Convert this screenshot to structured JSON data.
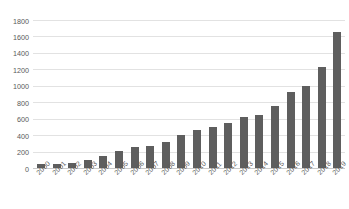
{
  "chart_data": {
    "type": "bar",
    "title": "",
    "subtitle": "",
    "xlabel": "",
    "ylabel": "",
    "categories": [
      "2000",
      "2001",
      "2002",
      "2003",
      "2004",
      "2005",
      "2006",
      "2007",
      "2008",
      "2009",
      "2010",
      "2011",
      "2012",
      "2013",
      "2014",
      "2015",
      "2016",
      "2017",
      "2018",
      "2019"
    ],
    "values": [
      45,
      45,
      65,
      100,
      150,
      205,
      255,
      270,
      315,
      405,
      465,
      500,
      545,
      620,
      650,
      760,
      930,
      1000,
      1230,
      1650
    ],
    "series": [
      {
        "name": "",
        "values": [
          45,
          45,
          65,
          100,
          150,
          205,
          255,
          270,
          315,
          405,
          465,
          500,
          545,
          620,
          650,
          760,
          930,
          1000,
          1230,
          1650
        ]
      }
    ],
    "ylim": [
      0,
      1800
    ],
    "yticks": [
      0,
      200,
      400,
      600,
      800,
      1000,
      1200,
      1400,
      1600,
      1800
    ],
    "ytick_labels": [
      "0",
      "200",
      "400",
      "600",
      "800",
      "1000",
      "1200",
      "1400",
      "1600",
      "1800"
    ],
    "grid": true,
    "grid_axis": "y",
    "legend": false,
    "legend_position": "none",
    "bar_color": "#5e5e5e",
    "gridline_color": "#e2e2e2",
    "axis_color": "#c9c9c9",
    "tick_label_color": "#595959",
    "xtick_rotation": -45,
    "background": "#ffffff"
  }
}
